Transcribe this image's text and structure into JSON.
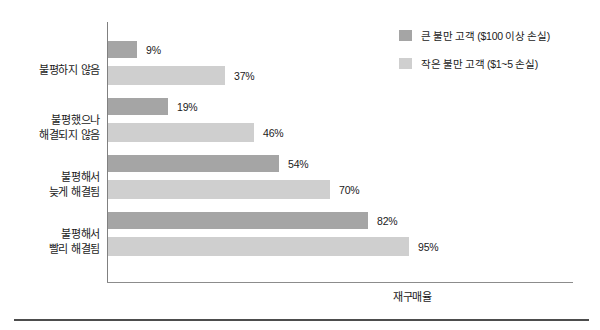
{
  "chart_data": {
    "type": "bar",
    "orientation": "horizontal",
    "title": "",
    "xlabel": "재구매율",
    "ylabel": "",
    "xlim": [
      0,
      100
    ],
    "grid": false,
    "legend_position": "top-right",
    "categories": [
      "불평하지 않음",
      "불평했으나\n해결되지 않음",
      "불평해서\n늦게 해결됨",
      "불평해서\n빨리 해결됨"
    ],
    "category_lines": [
      [
        "불평하지 않음"
      ],
      [
        "불평했으나",
        "해결되지 않음"
      ],
      [
        "불평해서",
        "늦게 해결됨"
      ],
      [
        "불평해서",
        "빨리 해결됨"
      ]
    ],
    "series": [
      {
        "name": "큰 불만 고객 ($100 이상 손실)",
        "color": "#a5a5a5",
        "values": [
          9,
          19,
          54,
          82
        ],
        "labels": [
          "9%",
          "19%",
          "54%",
          "82%"
        ]
      },
      {
        "name": "작은 불만 고객 ($1~5 손실)",
        "color": "#cfcfcf",
        "values": [
          37,
          46,
          70,
          95
        ],
        "labels": [
          "37%",
          "46%",
          "70%",
          "95%"
        ]
      }
    ]
  },
  "legend": {
    "items": [
      {
        "label": "큰 불만 고객 ($100 이상 손실)",
        "color": "#a5a5a5"
      },
      {
        "label": "작은 불만 고객 ($1~5 손실)",
        "color": "#cfcfcf"
      }
    ]
  },
  "axis": {
    "x_title": "재구매율"
  }
}
